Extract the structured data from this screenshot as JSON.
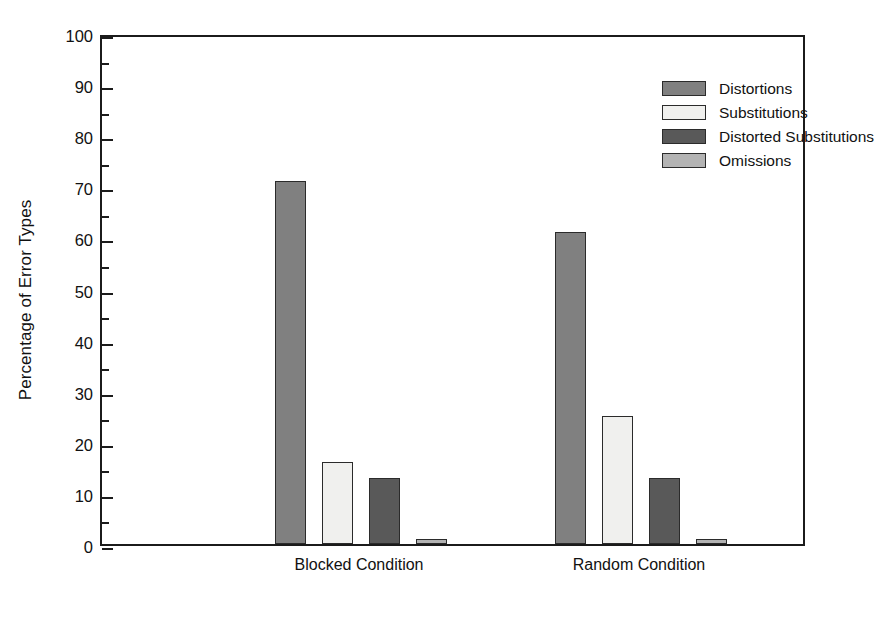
{
  "chart_data": {
    "type": "bar",
    "title": "",
    "subtitle": "",
    "xlabel": "",
    "ylabel": "Percentage of Error Types",
    "categories": [
      "Blocked Condition",
      "Random Condition"
    ],
    "series": [
      {
        "name": "Distortions",
        "color": "#808080",
        "values": [
          71,
          61
        ]
      },
      {
        "name": "Substitutions",
        "color": "#f0f0ee",
        "values": [
          16,
          25
        ]
      },
      {
        "name": "Distorted Substitutions",
        "color": "#595959",
        "values": [
          13,
          13
        ]
      },
      {
        "name": "Omissions",
        "color": "#b3b3b3",
        "values": [
          1,
          1
        ]
      }
    ],
    "ylim": [
      0,
      100
    ],
    "y_major_ticks": [
      0,
      10,
      20,
      30,
      40,
      50,
      60,
      70,
      80,
      90,
      100
    ],
    "y_minor_ticks": [
      5,
      15,
      25,
      35,
      45,
      55,
      65,
      75,
      85,
      95
    ],
    "y_tick_labels": [
      "0",
      "10",
      "20",
      "30",
      "40",
      "50",
      "60",
      "70",
      "80",
      "90",
      "100"
    ],
    "grid": false,
    "legend_position": "top-right",
    "legend_entries": [
      "Distortions",
      "Substitutions",
      "Distorted Substitutions",
      "Omissions"
    ],
    "axis_color": "#1b1b1b",
    "background_color": "#ffffff"
  }
}
